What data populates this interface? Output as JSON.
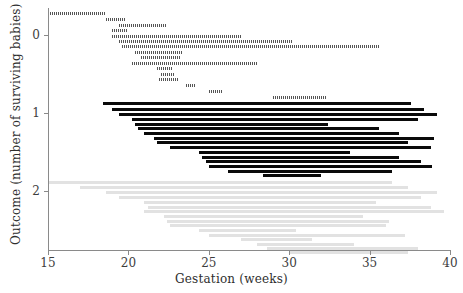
{
  "chart_data": {
    "type": "bar",
    "orientation": "horizontal",
    "title": "",
    "xlabel": "Gestation (weeks)",
    "ylabel": "Outcome (number of surviving babies)",
    "xlim": [
      15,
      40
    ],
    "ylim": [
      -0.35,
      2.75
    ],
    "xticks": [
      15,
      20,
      25,
      30,
      35,
      40
    ],
    "xticklabels": [
      "15",
      "20",
      "25",
      "30",
      "35",
      "40"
    ],
    "yticks": [
      0,
      1,
      2
    ],
    "yticklabels": [
      "0",
      "1",
      "2"
    ],
    "grid": false,
    "legend": null,
    "groups": [
      {
        "name": "outcome-0",
        "label": "0",
        "y_value": 0,
        "color": "#555555",
        "style": "dotted-hatched",
        "intervals": [
          {
            "start": 15.0,
            "end": 18.6,
            "y": -0.3
          },
          {
            "start": 18.6,
            "end": 19.8,
            "y": -0.22
          },
          {
            "start": 19.4,
            "end": 22.4,
            "y": -0.15
          },
          {
            "start": 19.0,
            "end": 20.0,
            "y": -0.08
          },
          {
            "start": 19.0,
            "end": 27.0,
            "y": -0.01
          },
          {
            "start": 19.4,
            "end": 30.2,
            "y": 0.06
          },
          {
            "start": 19.6,
            "end": 35.6,
            "y": 0.13
          },
          {
            "start": 20.4,
            "end": 23.4,
            "y": 0.2
          },
          {
            "start": 20.8,
            "end": 23.2,
            "y": 0.27
          },
          {
            "start": 20.2,
            "end": 28.0,
            "y": 0.34
          },
          {
            "start": 21.8,
            "end": 22.8,
            "y": 0.41
          },
          {
            "start": 22.0,
            "end": 22.9,
            "y": 0.48
          },
          {
            "start": 21.9,
            "end": 23.1,
            "y": 0.55
          },
          {
            "start": 23.6,
            "end": 24.2,
            "y": 0.62
          },
          {
            "start": 25.0,
            "end": 25.8,
            "y": 0.7
          },
          {
            "start": 29.0,
            "end": 32.3,
            "y": 0.78
          }
        ]
      },
      {
        "name": "outcome-1",
        "label": "1",
        "y_value": 1,
        "color": "#0a0a0a",
        "style": "solid",
        "intervals": [
          {
            "start": 18.4,
            "end": 37.6,
            "y": 0.86
          },
          {
            "start": 19.0,
            "end": 38.4,
            "y": 0.93
          },
          {
            "start": 19.4,
            "end": 39.2,
            "y": 1.0
          },
          {
            "start": 20.2,
            "end": 38.0,
            "y": 1.06
          },
          {
            "start": 20.4,
            "end": 32.4,
            "y": 1.12
          },
          {
            "start": 20.6,
            "end": 35.6,
            "y": 1.18
          },
          {
            "start": 21.0,
            "end": 36.8,
            "y": 1.24
          },
          {
            "start": 21.6,
            "end": 39.0,
            "y": 1.3
          },
          {
            "start": 21.8,
            "end": 37.4,
            "y": 1.36
          },
          {
            "start": 22.6,
            "end": 38.8,
            "y": 1.42
          },
          {
            "start": 24.4,
            "end": 33.8,
            "y": 1.48
          },
          {
            "start": 24.6,
            "end": 36.8,
            "y": 1.54
          },
          {
            "start": 24.8,
            "end": 38.2,
            "y": 1.6
          },
          {
            "start": 25.0,
            "end": 38.9,
            "y": 1.66
          },
          {
            "start": 26.2,
            "end": 36.4,
            "y": 1.72
          },
          {
            "start": 28.4,
            "end": 32.0,
            "y": 1.78
          }
        ]
      },
      {
        "name": "outcome-2",
        "label": "2",
        "y_value": 2,
        "color": "#e2e2e2",
        "style": "light-solid",
        "intervals": [
          {
            "start": 15.0,
            "end": 36.4,
            "y": 1.86
          },
          {
            "start": 17.0,
            "end": 37.4,
            "y": 1.93
          },
          {
            "start": 18.6,
            "end": 39.2,
            "y": 2.0
          },
          {
            "start": 19.4,
            "end": 38.2,
            "y": 2.06
          },
          {
            "start": 21.0,
            "end": 35.4,
            "y": 2.12
          },
          {
            "start": 21.2,
            "end": 38.8,
            "y": 2.18
          },
          {
            "start": 21.0,
            "end": 39.6,
            "y": 2.24
          },
          {
            "start": 22.2,
            "end": 34.6,
            "y": 2.3
          },
          {
            "start": 22.4,
            "end": 36.2,
            "y": 2.36
          },
          {
            "start": 22.6,
            "end": 36.0,
            "y": 2.42
          },
          {
            "start": 24.4,
            "end": 30.4,
            "y": 2.48
          },
          {
            "start": 25.0,
            "end": 37.2,
            "y": 2.54
          },
          {
            "start": 27.0,
            "end": 31.4,
            "y": 2.6
          },
          {
            "start": 28.0,
            "end": 34.0,
            "y": 2.66
          },
          {
            "start": 28.6,
            "end": 38.0,
            "y": 2.71
          },
          {
            "start": 30.0,
            "end": 37.4,
            "y": 2.76
          }
        ]
      }
    ]
  },
  "axes": {
    "x_title": "Gestation (weeks)",
    "y_title": "Outcome (number of surviving babies)",
    "x_tick_labels": [
      "15",
      "20",
      "25",
      "30",
      "35",
      "40"
    ],
    "y_tick_labels": [
      "0",
      "1",
      "2"
    ]
  },
  "colors": {
    "axis": "#8a8a8a",
    "text": "#2e2e2e",
    "group0": "#555555",
    "group1": "#0a0a0a",
    "group2": "#e2e2e2"
  }
}
